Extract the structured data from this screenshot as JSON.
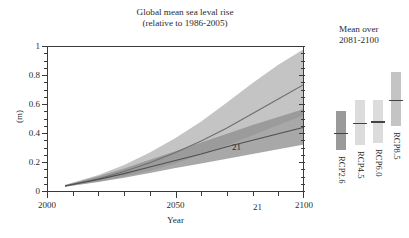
{
  "figure": {
    "title_lines": [
      "Global mean sea leval rise",
      "(relative to 1986-2005)"
    ],
    "side_note_lines": [
      "Mean over",
      "2081-2100"
    ],
    "xlabel": "Year",
    "ylabel": "(m)"
  },
  "chart_data": {
    "type": "area",
    "title": "Global mean sea leval rise (relative to 1986-2005)",
    "subtitle": "(relative to 1986-2005)",
    "xlabel": "Year",
    "ylabel": "(m)",
    "xlim": [
      2000,
      2100
    ],
    "ylim": [
      0,
      1
    ],
    "grid": false,
    "legend_position": "right-outside",
    "x_ticks_major": [
      2000,
      2050,
      2100
    ],
    "x_ticks_major_labels": [
      "2000",
      "2050",
      "2100"
    ],
    "x_ticks_minor": [
      2010,
      2020,
      2030,
      2040,
      2060,
      2070,
      2080,
      2090
    ],
    "y_ticks_major": [
      0,
      0.2,
      0.4,
      0.6,
      0.8,
      1
    ],
    "y_ticks_major_labels": [
      "0",
      "0.2",
      "0.4",
      "0.6",
      "0.8",
      "1"
    ],
    "y_ticks_minor": [
      0.05,
      0.1,
      0.15,
      0.25,
      0.3,
      0.35,
      0.45,
      0.5,
      0.55,
      0.65,
      0.7,
      0.75,
      0.85,
      0.9,
      0.95
    ],
    "annotations": [
      {
        "text": "21",
        "x": 2072,
        "y": 0.62
      },
      {
        "text": "21",
        "x": 2080,
        "y": 0.2
      }
    ],
    "x": [
      2007,
      2020,
      2030,
      2040,
      2050,
      2060,
      2070,
      2080,
      2090,
      2100
    ],
    "series": [
      {
        "name": "RCP8.5",
        "color": "#b4b4b4",
        "line_color": "#6e6e6e",
        "median": [
          0.035,
          0.085,
          0.135,
          0.195,
          0.265,
          0.345,
          0.435,
          0.535,
          0.635,
          0.735
        ],
        "lower": [
          0.03,
          0.065,
          0.1,
          0.14,
          0.19,
          0.25,
          0.315,
          0.385,
          0.455,
          0.525
        ],
        "upper": [
          0.042,
          0.11,
          0.18,
          0.265,
          0.365,
          0.48,
          0.61,
          0.745,
          0.87,
          0.98
        ]
      },
      {
        "name": "RCP2.6",
        "color": "#8f8f8f",
        "line_color": "#4f4f4f",
        "median": [
          0.035,
          0.08,
          0.12,
          0.165,
          0.21,
          0.255,
          0.305,
          0.35,
          0.395,
          0.44
        ],
        "lower": [
          0.03,
          0.062,
          0.092,
          0.125,
          0.158,
          0.19,
          0.222,
          0.255,
          0.288,
          0.32
        ],
        "upper": [
          0.042,
          0.102,
          0.155,
          0.215,
          0.275,
          0.335,
          0.395,
          0.455,
          0.51,
          0.565
        ]
      }
    ]
  },
  "legend_bars": {
    "title_lines": [
      "Mean over",
      "2081-2100"
    ],
    "items": [
      {
        "label": "RCP2.6",
        "color": "#9a9a9a",
        "low": 0.28,
        "high": 0.55,
        "median": 0.4
      },
      {
        "label": "RCP4.5",
        "color": "#dcdcdc",
        "low": 0.32,
        "high": 0.63,
        "median": 0.47
      },
      {
        "label": "RCP6.0",
        "color": "#dcdcdc",
        "low": 0.33,
        "high": 0.63,
        "median": 0.48
      },
      {
        "label": "RCP8.5",
        "color": "#c4c4c4",
        "low": 0.45,
        "high": 0.82,
        "median": 0.63
      }
    ]
  }
}
